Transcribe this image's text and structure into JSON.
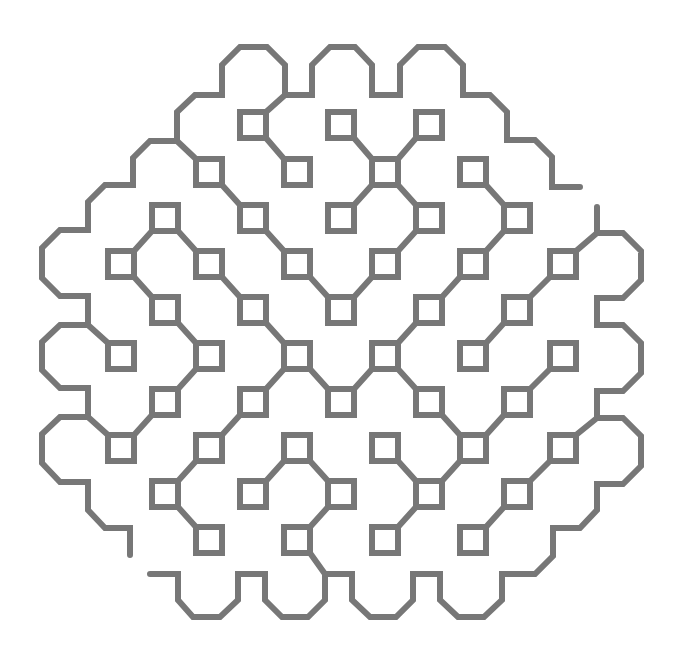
{
  "figure": {
    "title": "",
    "stroke_color": "#777777",
    "stroke_width": 6,
    "square_half_size": 13,
    "background": "#ffffff"
  },
  "squares": [
    {
      "id": "A1",
      "x": 253,
      "y": 125
    },
    {
      "id": "A2",
      "x": 341,
      "y": 125
    },
    {
      "id": "A3",
      "x": 429,
      "y": 125
    },
    {
      "id": "B1",
      "x": 209,
      "y": 172
    },
    {
      "id": "B2",
      "x": 297,
      "y": 172
    },
    {
      "id": "B3",
      "x": 385,
      "y": 172
    },
    {
      "id": "B4",
      "x": 473,
      "y": 172
    },
    {
      "id": "C1",
      "x": 165,
      "y": 218
    },
    {
      "id": "C2",
      "x": 253,
      "y": 218
    },
    {
      "id": "C3",
      "x": 341,
      "y": 218
    },
    {
      "id": "C4",
      "x": 429,
      "y": 218
    },
    {
      "id": "C5",
      "x": 517,
      "y": 218
    },
    {
      "id": "D1",
      "x": 121,
      "y": 264
    },
    {
      "id": "D2",
      "x": 209,
      "y": 264
    },
    {
      "id": "D3",
      "x": 297,
      "y": 264
    },
    {
      "id": "D4",
      "x": 385,
      "y": 264
    },
    {
      "id": "D5",
      "x": 473,
      "y": 264
    },
    {
      "id": "D6",
      "x": 563,
      "y": 264
    },
    {
      "id": "E1",
      "x": 165,
      "y": 310
    },
    {
      "id": "E2",
      "x": 253,
      "y": 310
    },
    {
      "id": "E3",
      "x": 341,
      "y": 310
    },
    {
      "id": "E4",
      "x": 429,
      "y": 310
    },
    {
      "id": "E5",
      "x": 517,
      "y": 310
    },
    {
      "id": "F1",
      "x": 121,
      "y": 356
    },
    {
      "id": "F2",
      "x": 209,
      "y": 356
    },
    {
      "id": "F3",
      "x": 297,
      "y": 356
    },
    {
      "id": "F4",
      "x": 385,
      "y": 356
    },
    {
      "id": "F5",
      "x": 473,
      "y": 356
    },
    {
      "id": "F6",
      "x": 563,
      "y": 356
    },
    {
      "id": "G1",
      "x": 165,
      "y": 402
    },
    {
      "id": "G2",
      "x": 253,
      "y": 402
    },
    {
      "id": "G3",
      "x": 341,
      "y": 402
    },
    {
      "id": "G4",
      "x": 429,
      "y": 402
    },
    {
      "id": "G5",
      "x": 517,
      "y": 402
    },
    {
      "id": "H1",
      "x": 121,
      "y": 448
    },
    {
      "id": "H2",
      "x": 209,
      "y": 448
    },
    {
      "id": "H3",
      "x": 297,
      "y": 448
    },
    {
      "id": "H4",
      "x": 385,
      "y": 448
    },
    {
      "id": "H5",
      "x": 473,
      "y": 448
    },
    {
      "id": "H6",
      "x": 563,
      "y": 448
    },
    {
      "id": "I1",
      "x": 165,
      "y": 494
    },
    {
      "id": "I2",
      "x": 253,
      "y": 494
    },
    {
      "id": "I3",
      "x": 341,
      "y": 494
    },
    {
      "id": "I4",
      "x": 429,
      "y": 494
    },
    {
      "id": "I5",
      "x": 517,
      "y": 494
    },
    {
      "id": "J1",
      "x": 209,
      "y": 540
    },
    {
      "id": "J2",
      "x": 297,
      "y": 540
    },
    {
      "id": "J3",
      "x": 385,
      "y": 540
    },
    {
      "id": "J4",
      "x": 473,
      "y": 540
    }
  ],
  "links": [
    [
      "A1",
      "B2"
    ],
    [
      "A2",
      "B3"
    ],
    [
      "A3",
      "B3"
    ],
    [
      "B3",
      "C3"
    ],
    [
      "B3",
      "C4"
    ],
    [
      "B1",
      "C2"
    ],
    [
      "B4",
      "C5"
    ],
    [
      "C5",
      "D5"
    ],
    [
      "C4",
      "D4"
    ],
    [
      "D4",
      "E3"
    ],
    [
      "D3",
      "E3"
    ],
    [
      "C2",
      "D3"
    ],
    [
      "D5",
      "E4"
    ],
    [
      "E4",
      "F4"
    ],
    [
      "D6",
      "E5"
    ],
    [
      "E5",
      "F5"
    ],
    [
      "C1",
      "D1"
    ],
    [
      "C1",
      "D2"
    ],
    [
      "D1",
      "E1"
    ],
    [
      "D2",
      "E2"
    ],
    [
      "E1",
      "F2"
    ],
    [
      "E2",
      "F3"
    ],
    [
      "F2",
      "G1"
    ],
    [
      "G1",
      "H1"
    ],
    [
      "F3",
      "G2"
    ],
    [
      "F3",
      "G3"
    ],
    [
      "G3",
      "F4"
    ],
    [
      "F4",
      "G4"
    ],
    [
      "G2",
      "H2"
    ],
    [
      "H2",
      "I1"
    ],
    [
      "I1",
      "J1"
    ],
    [
      "H3",
      "I2"
    ],
    [
      "H3",
      "I3"
    ],
    [
      "I3",
      "J2"
    ],
    [
      "G4",
      "H5"
    ],
    [
      "G5",
      "H5"
    ],
    [
      "G5",
      "F6"
    ],
    [
      "H4",
      "I4"
    ],
    [
      "I4",
      "H5"
    ],
    [
      "I4",
      "J3"
    ],
    [
      "H6",
      "I5"
    ],
    [
      "I5",
      "J4"
    ]
  ],
  "anchors": [
    {
      "square": "A1",
      "corner": "tr",
      "to": [
        285,
        95
      ]
    },
    {
      "square": "B1",
      "corner": "tl",
      "to": [
        177,
        141
      ]
    },
    {
      "square": "F1",
      "corner": "tl",
      "to": [
        88,
        325
      ]
    },
    {
      "square": "H1",
      "corner": "tl",
      "to": [
        88,
        417
      ]
    },
    {
      "square": "D6",
      "corner": "tr",
      "to": [
        597,
        233
      ]
    },
    {
      "square": "H6",
      "corner": "tr",
      "to": [
        597,
        418
      ]
    },
    {
      "square": "J2",
      "corner": "br",
      "to": [
        325,
        574
      ]
    }
  ],
  "outlines": [
    {
      "name": "outline-top-left",
      "points": [
        [
          88,
          325
        ],
        [
          88,
          296
        ],
        [
          60,
          296
        ],
        [
          42,
          278
        ],
        [
          42,
          248
        ],
        [
          60,
          230
        ],
        [
          88,
          230
        ],
        [
          88,
          202
        ],
        [
          105,
          185
        ],
        [
          133,
          185
        ],
        [
          133,
          158
        ],
        [
          150,
          141
        ],
        [
          177,
          141
        ],
        [
          177,
          112
        ],
        [
          195,
          95
        ],
        [
          222,
          95
        ],
        [
          222,
          65
        ],
        [
          240,
          47
        ],
        [
          267,
          47
        ],
        [
          285,
          65
        ],
        [
          285,
          95
        ],
        [
          312,
          95
        ],
        [
          312,
          65
        ],
        [
          330,
          47
        ],
        [
          355,
          47
        ],
        [
          372,
          65
        ],
        [
          372,
          95
        ],
        [
          400,
          95
        ],
        [
          400,
          65
        ],
        [
          418,
          47
        ],
        [
          445,
          47
        ],
        [
          463,
          65
        ],
        [
          463,
          95
        ],
        [
          490,
          95
        ],
        [
          507,
          112
        ],
        [
          507,
          140
        ],
        [
          535,
          140
        ],
        [
          552,
          157
        ],
        [
          552,
          187
        ],
        [
          580,
          187
        ]
      ]
    },
    {
      "name": "outline-left",
      "points": [
        [
          88,
          325
        ],
        [
          60,
          325
        ],
        [
          42,
          342
        ],
        [
          42,
          370
        ],
        [
          60,
          388
        ],
        [
          88,
          388
        ],
        [
          88,
          417
        ],
        [
          60,
          417
        ],
        [
          42,
          434
        ],
        [
          42,
          463
        ],
        [
          60,
          482
        ],
        [
          88,
          482
        ],
        [
          88,
          510
        ],
        [
          105,
          528
        ],
        [
          130,
          528
        ],
        [
          130,
          555
        ]
      ]
    },
    {
      "name": "outline-right-bottom",
      "points": [
        [
          597,
          207
        ],
        [
          597,
          233
        ],
        [
          623,
          233
        ],
        [
          641,
          251
        ],
        [
          641,
          280
        ],
        [
          623,
          298
        ],
        [
          597,
          298
        ],
        [
          597,
          325
        ],
        [
          623,
          325
        ],
        [
          641,
          343
        ],
        [
          641,
          373
        ],
        [
          623,
          391
        ],
        [
          597,
          391
        ],
        [
          597,
          418
        ],
        [
          623,
          418
        ],
        [
          641,
          436
        ],
        [
          641,
          466
        ],
        [
          623,
          484
        ],
        [
          597,
          484
        ],
        [
          597,
          510
        ],
        [
          580,
          528
        ],
        [
          553,
          528
        ],
        [
          553,
          556
        ],
        [
          535,
          574
        ],
        [
          502,
          574
        ],
        [
          502,
          600
        ],
        [
          484,
          617
        ],
        [
          458,
          617
        ],
        [
          440,
          600
        ],
        [
          440,
          574
        ],
        [
          413,
          574
        ],
        [
          413,
          600
        ],
        [
          396,
          617
        ],
        [
          370,
          617
        ],
        [
          352,
          600
        ],
        [
          352,
          574
        ],
        [
          325,
          574
        ],
        [
          325,
          600
        ],
        [
          308,
          617
        ],
        [
          282,
          617
        ],
        [
          265,
          600
        ],
        [
          265,
          574
        ],
        [
          238,
          574
        ],
        [
          238,
          600
        ],
        [
          220,
          617
        ],
        [
          193,
          617
        ],
        [
          178,
          600
        ],
        [
          178,
          574
        ],
        [
          150,
          574
        ]
      ]
    }
  ]
}
